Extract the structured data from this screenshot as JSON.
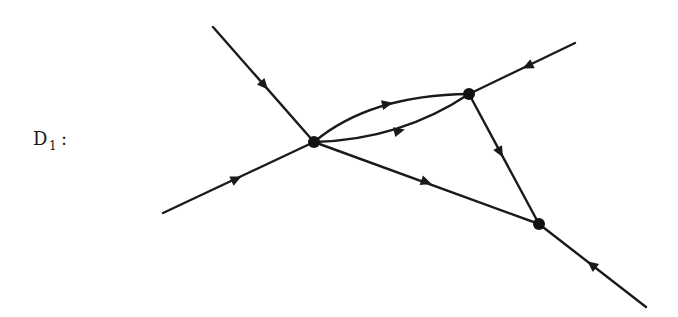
{
  "diagram": {
    "label": {
      "main": "D",
      "subscript": "1",
      "suffix": ":"
    },
    "colors": {
      "stroke": "#1a1a1a",
      "vertex": "#111111",
      "background": "#ffffff"
    },
    "vertices": [
      {
        "id": "v-left",
        "x": 314,
        "y": 142
      },
      {
        "id": "v-top",
        "x": 469,
        "y": 94
      },
      {
        "id": "v-bottom-right",
        "x": 539,
        "y": 224
      }
    ],
    "edges": [
      {
        "id": "external-top-left",
        "from": [
          213,
          27
        ],
        "to": "v-left",
        "arrow_at": [
          264,
          85
        ],
        "direction": "incoming"
      },
      {
        "id": "external-bottom-left",
        "from": [
          163,
          213
        ],
        "to": "v-left",
        "arrow_at": [
          236,
          179
        ],
        "direction": "incoming"
      },
      {
        "id": "external-top-right",
        "from": [
          575,
          43
        ],
        "to": "v-top",
        "arrow_at": [
          528,
          66
        ],
        "direction": "incoming"
      },
      {
        "id": "external-bottom-right",
        "from": [
          646,
          307
        ],
        "to": "v-bottom-right",
        "arrow_at": [
          592,
          265
        ],
        "direction": "incoming"
      },
      {
        "id": "arc-upper",
        "from": "v-left",
        "to": "v-top",
        "arrow_at": [
          387,
          104
        ],
        "direction": "left-to-top"
      },
      {
        "id": "arc-lower",
        "from": "v-left",
        "to": "v-top",
        "arrow_at": [
          399,
          131
        ],
        "direction": "left-to-top"
      },
      {
        "id": "internal-left-bottom",
        "from": "v-left",
        "to": "v-bottom-right",
        "arrow_at": [
          426,
          182
        ],
        "direction": "left-to-bottom-right"
      },
      {
        "id": "internal-top-bottom",
        "from": "v-top",
        "to": "v-bottom-right",
        "arrow_at": [
          500,
          152
        ],
        "direction": "top-to-bottom-right"
      }
    ]
  }
}
